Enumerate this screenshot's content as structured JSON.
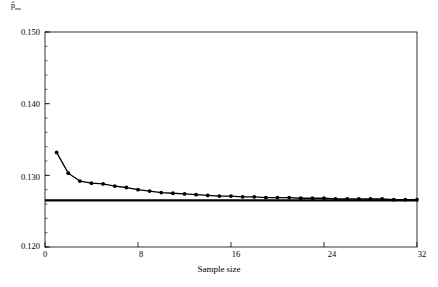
{
  "chart_data": {
    "type": "line",
    "title": "",
    "subtitle": "",
    "xlabel": "Sample size",
    "ylabel": "p̂",
    "ylabel_sub": "mc",
    "xlim": [
      0,
      32
    ],
    "ylim": [
      0.12,
      0.15
    ],
    "xticks": [
      0,
      8,
      16,
      24,
      32
    ],
    "xtick_labels": [
      "0",
      "8",
      "16",
      "24",
      "32"
    ],
    "yticks": [
      0.12,
      0.13,
      0.14,
      0.15
    ],
    "ytick_labels": [
      "0.120",
      "0.130",
      "0.140",
      "0.150"
    ],
    "minor_ticks": true,
    "grid": false,
    "legend": null,
    "series": [
      {
        "name": "p-hat-mc",
        "marker": "filled-circle",
        "x": [
          1,
          2,
          3,
          4,
          5,
          6,
          7,
          8,
          9,
          10,
          11,
          12,
          13,
          14,
          15,
          16,
          17,
          18,
          19,
          20,
          21,
          22,
          23,
          24,
          25,
          26,
          27,
          28,
          29,
          30,
          31,
          32
        ],
        "values": [
          0.1332,
          0.1303,
          0.1292,
          0.1289,
          0.1288,
          0.1285,
          0.1283,
          0.128,
          0.1278,
          0.1276,
          0.1275,
          0.1274,
          0.1273,
          0.1272,
          0.1271,
          0.1271,
          0.127,
          0.127,
          0.1269,
          0.1269,
          0.1269,
          0.1268,
          0.1268,
          0.1268,
          0.1267,
          0.1267,
          0.1267,
          0.1267,
          0.1267,
          0.1266,
          0.1266,
          0.1266
        ]
      }
    ],
    "reference_line": {
      "name": "asymptotic-value",
      "orientation": "horizontal",
      "value": 0.1265
    },
    "annotations": []
  },
  "axis": {
    "y_label_text": "p̂",
    "y_label_sub": "mc",
    "x_title": "Sample size"
  },
  "colors": {
    "axis": "#000000",
    "series": "#000000",
    "reference_line": "#000000",
    "background": "#ffffff"
  }
}
